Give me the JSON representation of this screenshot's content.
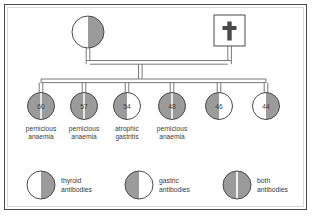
{
  "figure": {
    "colors": {
      "fill_gray": "#9b9b9b",
      "fill_white": "#ffffff",
      "stroke": "#4a4a4a",
      "line": "#6b6b6b",
      "text": "#3a3a3a",
      "frame": "#4a4a4a",
      "inner_frame": "#d8d8d8",
      "background": "#ffffff"
    }
  },
  "generation1": {
    "mother": {
      "symbol": "circle",
      "antibody_status": "thyroid",
      "left_half": "white",
      "right_half": "gray",
      "cx": 88,
      "cy": 32,
      "r": 16
    },
    "father": {
      "symbol": "square",
      "deceased": true,
      "deceased_marker": "cross",
      "antibody_status": "none",
      "fill": "white",
      "x": 214,
      "y": 15,
      "size": 31
    }
  },
  "generation2": {
    "members": [
      {
        "age": "60",
        "diagnosis_line1": "pernicious",
        "diagnosis_line2": "anaemia",
        "antibody_status": "both",
        "left_half": "gray",
        "right_half": "gray",
        "cx": 41,
        "cy": 106,
        "r": 13.5
      },
      {
        "age": "57",
        "diagnosis_line1": "pernicious",
        "diagnosis_line2": "anaemia",
        "antibody_status": "both",
        "left_half": "gray",
        "right_half": "gray",
        "cx": 84,
        "cy": 106,
        "r": 13.5
      },
      {
        "age": "54",
        "diagnosis_line1": "atrophic",
        "diagnosis_line2": "gastritis",
        "antibody_status": "gastric",
        "left_half": "gray",
        "right_half": "white",
        "cx": 127,
        "cy": 106,
        "r": 13.5
      },
      {
        "age": "48",
        "diagnosis_line1": "pernicious",
        "diagnosis_line2": "anaemia",
        "antibody_status": "both",
        "left_half": "gray",
        "right_half": "gray",
        "cx": 172,
        "cy": 106,
        "r": 13.5
      },
      {
        "age": "46",
        "diagnosis_line1": "",
        "diagnosis_line2": "",
        "antibody_status": "gastric",
        "left_half": "gray",
        "right_half": "white",
        "cx": 219,
        "cy": 106,
        "r": 13.5
      },
      {
        "age": "44",
        "diagnosis_line1": "",
        "diagnosis_line2": "",
        "antibody_status": "thyroid",
        "left_half": "white",
        "right_half": "gray",
        "cx": 266,
        "cy": 106,
        "r": 13.5
      }
    ]
  },
  "legend": {
    "items": [
      {
        "label_line1": "thyroid",
        "label_line2": "antibodies",
        "antibody_status": "thyroid",
        "left_half": "white",
        "right_half": "gray",
        "cx": 41,
        "cy": 185,
        "r": 14,
        "text_x": 61,
        "text_y": 177
      },
      {
        "label_line1": "gastric",
        "label_line2": "antibodies",
        "antibody_status": "gastric",
        "left_half": "gray",
        "right_half": "white",
        "cx": 139,
        "cy": 185,
        "r": 14,
        "text_x": 159,
        "text_y": 177
      },
      {
        "label_line1": "both",
        "label_line2": "antibodies",
        "antibody_status": "both",
        "left_half": "gray",
        "right_half": "gray",
        "cx": 237,
        "cy": 185,
        "r": 14,
        "text_x": 257,
        "text_y": 177
      }
    ]
  }
}
